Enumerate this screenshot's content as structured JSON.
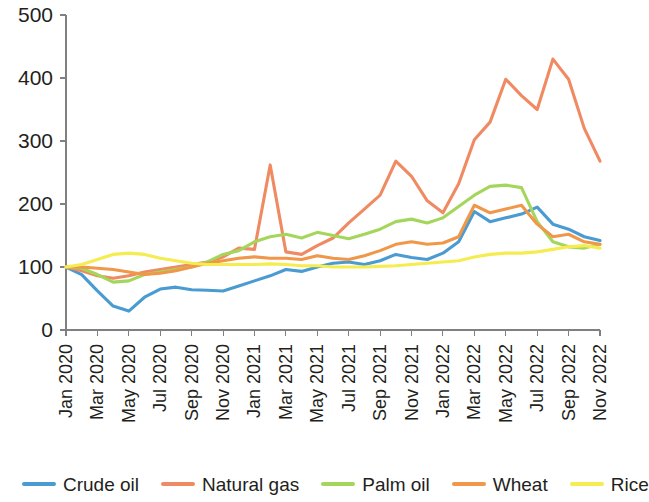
{
  "chart_data": {
    "type": "line",
    "title": "",
    "subtitle": "",
    "xlabel": "",
    "ylabel": "",
    "ylim": [
      0,
      500
    ],
    "yticks": [
      0,
      100,
      200,
      300,
      400,
      500
    ],
    "grid": false,
    "legend_position": "bottom",
    "x": [
      "Jan 2020",
      "Feb 2020",
      "Mar 2020",
      "Apr 2020",
      "May 2020",
      "Jun 2020",
      "Jul 2020",
      "Aug 2020",
      "Sep 2020",
      "Oct 2020",
      "Nov 2020",
      "Dec 2020",
      "Jan 2021",
      "Feb 2021",
      "Mar 2021",
      "Apr 2021",
      "May 2021",
      "Jun 2021",
      "Jul 2021",
      "Aug 2021",
      "Sep 2021",
      "Oct 2021",
      "Nov 2021",
      "Dec 2021",
      "Jan 2022",
      "Feb 2022",
      "Mar 2022",
      "Apr 2022",
      "May 2022",
      "Jun 2022",
      "Jul 2022",
      "Aug 2022",
      "Sep 2022",
      "Oct 2022",
      "Nov 2022"
    ],
    "xtick_labels": [
      "Jan 2020",
      "Mar 2020",
      "May 2020",
      "Jul 2020",
      "Sep 2020",
      "Nov 2020",
      "Jan 2021",
      "Mar 2021",
      "May 2021",
      "Jul 2021",
      "Sep 2021",
      "Nov 2021",
      "Jan 2022",
      "Mar 2022",
      "May 2022",
      "Jul 2022",
      "Sep 2022",
      "Nov 2022"
    ],
    "xtick_indices": [
      0,
      2,
      4,
      6,
      8,
      10,
      12,
      14,
      16,
      18,
      20,
      22,
      24,
      26,
      28,
      30,
      32,
      34
    ],
    "series": [
      {
        "name": "Crude oil",
        "color": "#4A9BD1",
        "values": [
          100,
          88,
          62,
          38,
          30,
          52,
          65,
          68,
          64,
          63,
          62,
          70,
          78,
          86,
          96,
          93,
          100,
          106,
          108,
          104,
          110,
          120,
          115,
          112,
          122,
          140,
          188,
          172,
          178,
          184,
          195,
          168,
          160,
          148,
          142
        ]
      },
      {
        "name": "Natural gas",
        "color": "#F08A62",
        "values": [
          100,
          94,
          86,
          82,
          86,
          92,
          96,
          100,
          104,
          108,
          116,
          130,
          128,
          262,
          124,
          120,
          134,
          146,
          170,
          192,
          214,
          268,
          244,
          205,
          186,
          232,
          302,
          330,
          398,
          372,
          350,
          430,
          398,
          320,
          268
        ]
      },
      {
        "name": "Palm oil",
        "color": "#A5D65C",
        "values": [
          100,
          98,
          88,
          76,
          78,
          88,
          92,
          96,
          100,
          108,
          120,
          126,
          140,
          148,
          152,
          146,
          155,
          150,
          145,
          152,
          160,
          172,
          176,
          170,
          178,
          196,
          214,
          228,
          230,
          226,
          172,
          140,
          132,
          130,
          136
        ]
      },
      {
        "name": "Wheat",
        "color": "#F0974A",
        "values": [
          100,
          100,
          98,
          96,
          92,
          88,
          90,
          94,
          100,
          106,
          110,
          114,
          116,
          114,
          114,
          112,
          118,
          114,
          112,
          118,
          126,
          136,
          140,
          136,
          138,
          148,
          198,
          186,
          192,
          198,
          168,
          148,
          152,
          140,
          136
        ]
      },
      {
        "name": "Rice",
        "color": "#F5EC50",
        "values": [
          100,
          104,
          112,
          120,
          122,
          120,
          114,
          110,
          106,
          104,
          104,
          104,
          104,
          105,
          104,
          102,
          102,
          100,
          100,
          100,
          101,
          102,
          104,
          106,
          108,
          110,
          116,
          120,
          122,
          122,
          124,
          128,
          132,
          134,
          130
        ]
      }
    ]
  },
  "legend": {
    "items": [
      {
        "label": "Crude oil",
        "color": "#4A9BD1"
      },
      {
        "label": "Natural gas",
        "color": "#F08A62"
      },
      {
        "label": "Palm oil",
        "color": "#A5D65C"
      },
      {
        "label": "Wheat",
        "color": "#F0974A"
      },
      {
        "label": "Rice",
        "color": "#F5EC50"
      }
    ]
  }
}
